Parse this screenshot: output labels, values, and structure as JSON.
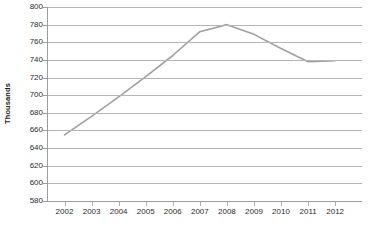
{
  "chart_data": {
    "type": "line",
    "title": "",
    "xlabel": "",
    "ylabel": "Thousands",
    "categories": [
      "2002",
      "2003",
      "2004",
      "2005",
      "2006",
      "2007",
      "2008",
      "2009",
      "2010",
      "2011",
      "2012"
    ],
    "values": [
      655,
      676,
      698,
      721,
      745,
      772,
      780,
      769,
      753,
      738,
      739
    ],
    "series": [
      {
        "name": "",
        "values": [
          655,
          676,
          698,
          721,
          745,
          772,
          780,
          769,
          753,
          738,
          739
        ]
      }
    ],
    "ylim": [
      580,
      800
    ],
    "ytick_step": 20,
    "yticks": [
      800,
      780,
      760,
      740,
      720,
      700,
      680,
      660,
      640,
      620,
      600,
      580
    ],
    "ytick_labels": [
      "800",
      "780",
      "760",
      "740",
      "720",
      "700",
      "680",
      "660",
      "640",
      "620",
      "600",
      "580"
    ],
    "xticks": [
      "2002",
      "2003",
      "2004",
      "2005",
      "2006",
      "2007",
      "2008",
      "2009",
      "2010",
      "2011",
      "2012"
    ],
    "grid": true,
    "grid_axis": "y",
    "legend": false,
    "legend_position": "none",
    "line_color": "#a0a0a0",
    "line_width": 1.6,
    "markers": false,
    "background_color": "#ffffff",
    "gridline_color": "#b5b5b5",
    "axis_color": "#9c9c9c",
    "text_color": "#2b2b2b"
  }
}
